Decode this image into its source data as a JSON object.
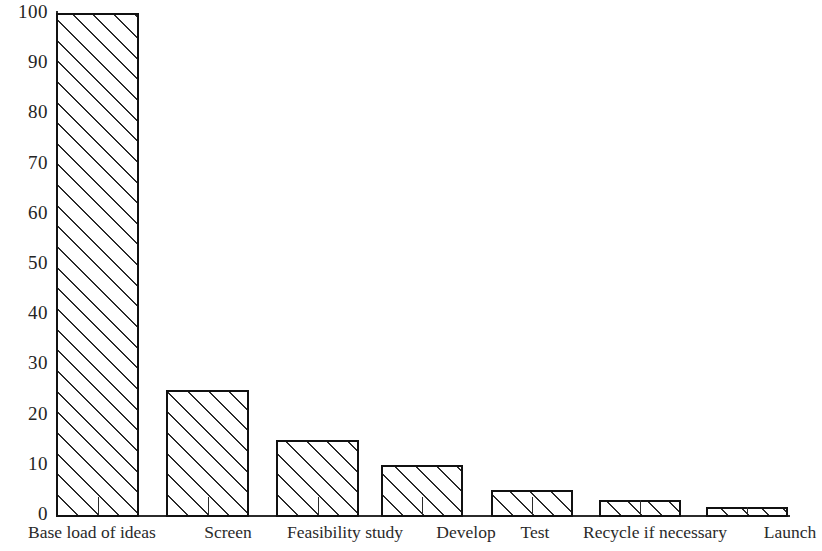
{
  "figure": {
    "background_color": "#ffffff",
    "ink_color": "#1a1a1a",
    "bar_border_color": "#111111",
    "bar_fill": "diagonal-hatch"
  },
  "chart_data": {
    "type": "bar",
    "title": "",
    "subtitle": "",
    "xlabel": "",
    "ylabel": "",
    "categories": [
      "Base load of ideas",
      "Screen",
      "Feasibility study",
      "Develop",
      "Test",
      "Recycle if necessary",
      "Launch"
    ],
    "values": [
      100,
      25,
      15,
      10,
      5,
      3,
      1.5
    ],
    "ylim": [
      0,
      100
    ],
    "ytick_labels": [
      "0",
      "10",
      "20",
      "30",
      "40",
      "50",
      "60",
      "70",
      "80",
      "90",
      "100"
    ],
    "ytick_values": [
      0,
      10,
      20,
      30,
      40,
      50,
      60,
      70,
      80,
      90,
      100
    ],
    "grid": false,
    "legend": null,
    "legend_position": "none",
    "annotations": [],
    "bar_style": "white fill with 45-degree diagonal hatching and black outline"
  },
  "axes": {
    "y_axis_name": "y-axis",
    "x_axis_name": "x-axis",
    "y_axis_visible": true,
    "x_axis_visible": true
  },
  "bars": [
    {
      "label": "Base load of ideas",
      "value": 100,
      "left": 56,
      "width": 83
    },
    {
      "label": "Screen",
      "value": 25,
      "left": 166,
      "width": 83
    },
    {
      "label": "Feasibility study",
      "value": 15,
      "left": 276,
      "width": 83
    },
    {
      "label": "Develop",
      "value": 10,
      "left": 381,
      "width": 82
    },
    {
      "label": "Test",
      "value": 5,
      "left": 491,
      "width": 82
    },
    {
      "label": "Recycle if necessary",
      "value": 3,
      "left": 599,
      "width": 82
    },
    {
      "label": "Launch",
      "value": 1.5,
      "left": 706,
      "width": 82
    }
  ],
  "x_labels": [
    {
      "text": "Base load of ideas",
      "left": 2,
      "width": 180
    },
    {
      "text": "Screen",
      "left": 186,
      "width": 84
    },
    {
      "text": "Feasibility study",
      "left": 272,
      "width": 146
    },
    {
      "text": "Develop",
      "left": 420,
      "width": 92
    },
    {
      "text": "Test",
      "left": 505,
      "width": 60
    },
    {
      "text": "Recycle if necessary",
      "left": 563,
      "width": 184
    },
    {
      "text": "Launch",
      "left": 752,
      "width": 76
    }
  ]
}
